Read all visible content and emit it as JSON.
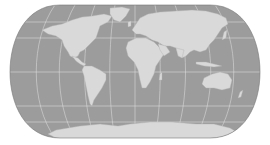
{
  "map": {
    "projection": "eckert-iv-like",
    "colors": {
      "background": "#ffffff",
      "ocean": "#9c9c9c",
      "land": "#d9d9d9",
      "land_shade": "#c6c6c6",
      "graticule": "#e4e4e4",
      "outline": "#777777"
    },
    "graticule": {
      "meridians_deg": [
        -150,
        -120,
        -90,
        -60,
        -30,
        0,
        30,
        60,
        90,
        120,
        150
      ],
      "parallels_deg": [
        -60,
        -30,
        0,
        30,
        60
      ]
    },
    "features": [
      {
        "name": "north-america"
      },
      {
        "name": "greenland"
      },
      {
        "name": "south-america"
      },
      {
        "name": "europe"
      },
      {
        "name": "africa"
      },
      {
        "name": "asia"
      },
      {
        "name": "australia"
      },
      {
        "name": "antarctica"
      },
      {
        "name": "madagascar"
      },
      {
        "name": "japan"
      },
      {
        "name": "british-isles"
      },
      {
        "name": "indonesia"
      },
      {
        "name": "new-zealand"
      }
    ]
  }
}
